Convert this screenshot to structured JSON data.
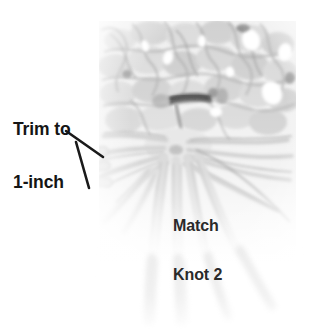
{
  "figure": {
    "kind": "instructional-photograph",
    "palette": {
      "background": "#ffffff",
      "photo_light": "#f2f2f2",
      "photo_mid": "#d2d2d2",
      "photo_shadow": "#9a9a9a",
      "photo_dark": "#555555",
      "annotation_text": "#151515",
      "leader_line": "#1a1a1a"
    }
  },
  "annotations": {
    "trim": {
      "line1": "Trim to",
      "line2": "1-inch"
    },
    "match": {
      "line1": "Match",
      "line2": "Knot 2"
    }
  }
}
